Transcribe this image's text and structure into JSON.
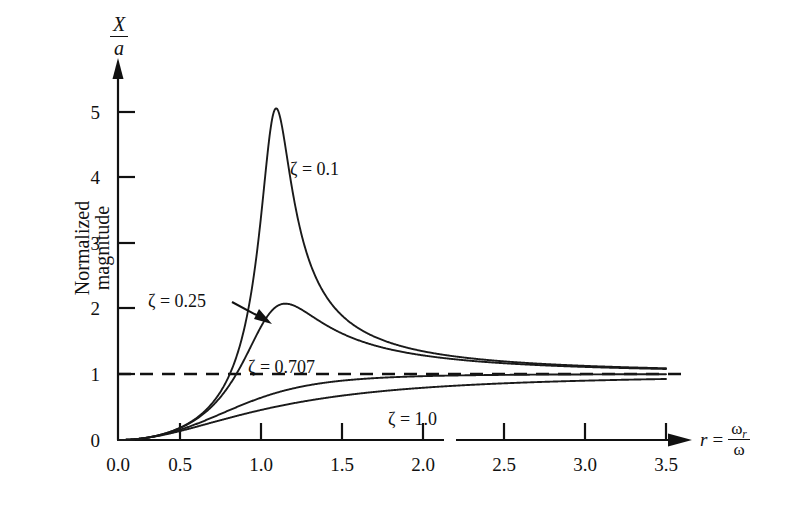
{
  "chart_data": {
    "type": "line",
    "title": "",
    "xlabel": "r = ωr/ω",
    "ylabel": "X/a",
    "ylabel_caption": "Normalized magnitude",
    "xlim": [
      0.0,
      3.5
    ],
    "ylim": [
      0,
      5.6
    ],
    "grid": false,
    "legend_position": "inline-annotations",
    "x_ticks": [
      "0.0",
      "0.5",
      "1.0",
      "1.5",
      "2.0",
      "2.5",
      "3.0",
      "3.5"
    ],
    "x_tick_values": [
      0.0,
      0.5,
      1.0,
      1.5,
      2.0,
      2.5,
      3.0,
      3.5
    ],
    "y_ticks": [
      "0",
      "1",
      "2",
      "3",
      "4",
      "5"
    ],
    "y_tick_values": [
      0,
      1,
      2,
      3,
      4,
      5
    ],
    "formula": "X/a = r^2 / sqrt((1-r^2)^2 + (2*zeta*r)^2)",
    "reference_line": {
      "value": 1,
      "style": "dashed",
      "label": "1"
    },
    "series": [
      {
        "name": "ζ = 0.1",
        "zeta": 0.1,
        "annotation": "ζ = 0.1",
        "peak_x": 1.01,
        "peak_y": 5.03,
        "x": [
          0.0,
          0.1,
          0.2,
          0.3,
          0.4,
          0.5,
          0.6,
          0.7,
          0.8,
          0.9,
          0.95,
          1.0,
          1.01,
          1.05,
          1.1,
          1.2,
          1.3,
          1.5,
          1.75,
          2.0,
          2.5,
          3.0,
          3.5
        ],
        "values": [
          0.0,
          0.01,
          0.042,
          0.099,
          0.19,
          0.33,
          0.56,
          0.95,
          1.73,
          3.27,
          4.45,
          5.0,
          5.03,
          4.38,
          3.06,
          1.85,
          1.41,
          1.14,
          1.06,
          1.03,
          1.01,
          1.0,
          1.0
        ]
      },
      {
        "name": "ζ = 0.25",
        "zeta": 0.25,
        "annotation": "ζ = 0.25",
        "peak_x": 1.07,
        "peak_y": 2.07,
        "x": [
          0.0,
          0.1,
          0.2,
          0.3,
          0.4,
          0.5,
          0.6,
          0.7,
          0.8,
          0.9,
          1.0,
          1.07,
          1.2,
          1.3,
          1.5,
          1.75,
          2.0,
          2.5,
          3.0,
          3.5
        ],
        "values": [
          0.0,
          0.01,
          0.042,
          0.098,
          0.186,
          0.317,
          0.51,
          0.79,
          1.15,
          1.61,
          2.0,
          2.07,
          1.89,
          1.69,
          1.38,
          1.2,
          1.11,
          1.04,
          1.02,
          1.01
        ]
      },
      {
        "name": "ζ = 0.707",
        "zeta": 0.707,
        "annotation": "ζ = 0.707",
        "peak_x": null,
        "peak_y": null,
        "x": [
          0.0,
          0.25,
          0.5,
          0.75,
          1.0,
          1.25,
          1.5,
          1.75,
          2.0,
          2.5,
          3.0,
          3.5
        ],
        "values": [
          0.0,
          0.062,
          0.25,
          0.52,
          0.707,
          0.82,
          0.88,
          0.92,
          0.94,
          0.97,
          0.98,
          0.99
        ]
      },
      {
        "name": "ζ = 1.0",
        "zeta": 1.0,
        "annotation": "ζ = 1.0",
        "peak_x": null,
        "peak_y": null,
        "x": [
          0.0,
          0.25,
          0.5,
          0.75,
          1.0,
          1.25,
          1.5,
          1.75,
          2.0,
          2.5,
          3.0,
          3.5
        ],
        "values": [
          0.0,
          0.059,
          0.2,
          0.36,
          0.5,
          0.61,
          0.69,
          0.75,
          0.8,
          0.86,
          0.9,
          0.92
        ]
      }
    ]
  },
  "axes": {
    "y_title_numerator": "X",
    "y_title_denominator": "a",
    "y_caption_line1": "Normalized",
    "y_caption_line2": "magnitude",
    "x_title_variable": "r",
    "x_title_equals": "=",
    "x_title_numerator": "ω",
    "x_title_numerator_sub": "r",
    "x_title_denominator": "ω"
  },
  "colors": {
    "ink": "#111111",
    "background": "#ffffff",
    "curve": "#1a1a1a",
    "dashed_reference": "#111111"
  }
}
